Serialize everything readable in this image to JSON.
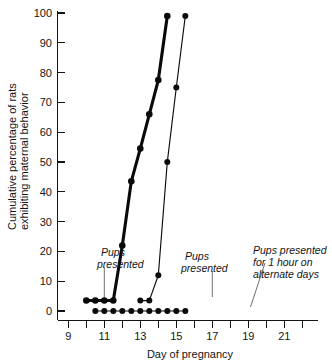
{
  "chart_data": {
    "type": "line",
    "title": "",
    "xlabel": "Day of pregnancy",
    "ylabel": "Cumulative percentage of rats exhibiting maternal behavior",
    "ylabel_line1": "Cumulative percentage of rats",
    "ylabel_line2": "exhibiting maternal behavior",
    "xlim": [
      8.4,
      22.6
    ],
    "ylim": [
      0,
      100
    ],
    "grid": false,
    "legend_position": "none",
    "x_major_ticks": [
      9,
      11,
      13,
      15,
      17,
      19,
      21
    ],
    "x_minor_ticks": [
      10,
      12,
      14,
      16,
      18,
      20,
      22
    ],
    "x_tick_labels": [
      "9",
      "11",
      "13",
      "15",
      "17",
      "19",
      "21"
    ],
    "y_ticks": [
      0,
      10,
      20,
      30,
      40,
      50,
      60,
      70,
      80,
      90,
      100
    ],
    "y_tick_labels": [
      "0",
      "10",
      "20",
      "30",
      "40",
      "50",
      "60",
      "70",
      "80",
      "90",
      "100"
    ],
    "series": [
      {
        "name": "Pups presented from day 11",
        "style": "thick",
        "x": [
          11,
          12,
          13,
          14,
          15,
          16,
          17,
          18,
          19,
          20
        ],
        "values": [
          3.5,
          3.5,
          3.5,
          3.5,
          22,
          43.5,
          54.5,
          66,
          77.5,
          99
        ]
      },
      {
        "name": "Pups presented from day 17",
        "style": "thin",
        "x": [
          17,
          18,
          19,
          20,
          21,
          22
        ],
        "values": [
          3.5,
          3.5,
          12,
          50,
          75,
          99
        ]
      },
      {
        "name": "Pups presented for 1 hour on alternate days",
        "style": "thin",
        "x": [
          12,
          13,
          14,
          15,
          16,
          17,
          18,
          19,
          20,
          21,
          22
        ],
        "values": [
          0,
          0,
          0,
          0,
          0,
          0,
          0,
          0,
          0,
          0,
          0
        ]
      }
    ],
    "annotations": [
      {
        "id": "annotation-pups-presented-day11",
        "lines": [
          "Pups",
          "presented"
        ],
        "text": "Pups presented",
        "target_x": 11,
        "target_y": 3.5
      },
      {
        "id": "annotation-pups-presented-day17",
        "lines": [
          "Pups",
          "presented"
        ],
        "text": "Pups presented",
        "target_x": 17,
        "target_y": 3.5
      },
      {
        "id": "annotation-alternate-days",
        "lines": [
          "Pups presented",
          "for 1 hour on",
          "alternate days"
        ],
        "text": "Pups presented for 1 hour on alternate days",
        "target_x": 19.2,
        "target_y": 0
      }
    ],
    "colors": {
      "ink": "#0a0a0a",
      "axis": "#141414",
      "leader": "#555555",
      "background": "#ffffff"
    }
  }
}
